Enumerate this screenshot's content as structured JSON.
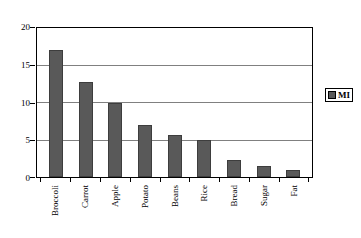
{
  "chart_data": {
    "type": "bar",
    "title": "",
    "subtitle": "",
    "xlabel": "",
    "ylabel": "",
    "categories": [
      "Broccoli",
      "Carrot",
      "Apple",
      "Potato",
      "Beans",
      "Rice",
      "Bread",
      "Sugar",
      "Fat"
    ],
    "values": [
      17.0,
      12.8,
      9.9,
      7.0,
      5.6,
      5.0,
      2.3,
      1.5,
      1.0
    ],
    "series": [
      {
        "name": "MI",
        "values": [
          17.0,
          12.8,
          9.9,
          7.0,
          5.6,
          5.0,
          2.3,
          1.5,
          1.0
        ],
        "color": "#595959"
      }
    ],
    "ylim": [
      0,
      20
    ],
    "ytick_values": [
      0,
      5,
      10,
      15,
      20
    ],
    "ytick_labels": [
      "0",
      "5",
      "10",
      "15",
      "20"
    ],
    "grid": true,
    "grid_axis": "y",
    "grid_color": "#808080",
    "legend": {
      "position": "right",
      "entries": [
        {
          "label": "MI",
          "color": "#595959"
        }
      ]
    },
    "xtick_label_rotation": -90,
    "frame_color": "#000000",
    "background": "#ffffff",
    "bar_color": "#595959",
    "bar_edge_color": "#3d3d3d"
  }
}
